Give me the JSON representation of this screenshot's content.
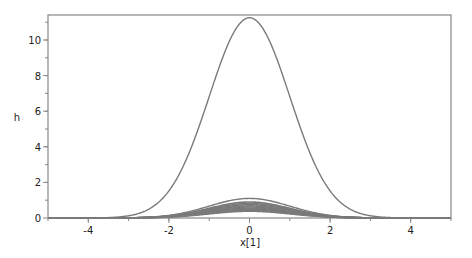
{
  "chart_data": {
    "type": "line",
    "title": "",
    "xlabel": "x[1]",
    "ylabel": "h",
    "xlim": [
      -5,
      5
    ],
    "ylim": [
      0,
      11.3
    ],
    "grid": false,
    "legend": null,
    "x_ticks": [
      -4,
      -2,
      0,
      2,
      4
    ],
    "y_ticks": [
      0,
      2,
      4,
      6,
      8,
      10
    ],
    "line_color": "#7a7a7a",
    "series": [
      {
        "name": "curve-1",
        "shape": "gaussian",
        "center": 0,
        "peak": 11.25,
        "sigma": 1.0
      },
      {
        "name": "curve-2",
        "shape": "gaussian",
        "center": 0,
        "peak": 1.1,
        "sigma": 1.0
      },
      {
        "name": "curve-3",
        "shape": "gaussian",
        "center": 0,
        "peak": 0.9,
        "sigma": 1.0
      },
      {
        "name": "curve-4",
        "shape": "gaussian",
        "center": 0,
        "peak": 0.82,
        "sigma": 1.0
      },
      {
        "name": "curve-5",
        "shape": "gaussian",
        "center": 0,
        "peak": 0.75,
        "sigma": 1.0
      },
      {
        "name": "curve-6",
        "shape": "gaussian",
        "center": 0,
        "peak": 0.68,
        "sigma": 1.0
      },
      {
        "name": "curve-7",
        "shape": "gaussian",
        "center": 0,
        "peak": 0.62,
        "sigma": 1.0
      },
      {
        "name": "curve-8",
        "shape": "gaussian",
        "center": 0,
        "peak": 0.56,
        "sigma": 1.0
      },
      {
        "name": "curve-9",
        "shape": "gaussian",
        "center": 0,
        "peak": 0.5,
        "sigma": 1.0
      },
      {
        "name": "curve-10",
        "shape": "gaussian",
        "center": 0,
        "peak": 0.44,
        "sigma": 1.0
      },
      {
        "name": "curve-11",
        "shape": "gaussian",
        "center": 0,
        "peak": 0.38,
        "sigma": 1.0
      }
    ]
  }
}
